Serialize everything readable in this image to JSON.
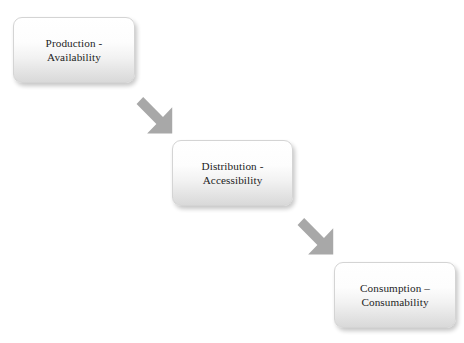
{
  "diagram": {
    "type": "flowchart",
    "orientation": "descending-diagonal",
    "background_color": "#ffffff",
    "nodes": [
      {
        "id": "production",
        "label": "Production -\nAvailability",
        "line_one": "Production -",
        "line_two": "Availability",
        "shape": "rounded-rectangle",
        "fill_top_color": "#ffffff",
        "fill_bottom_color": "#d9d9d9",
        "border_color": "#d4d4d4",
        "text_color": "#1d1d1d"
      },
      {
        "id": "distribution",
        "label": "Distribution -\nAccessibility",
        "line_one": "Distribution -",
        "line_two": "Accessibility",
        "shape": "rounded-rectangle",
        "fill_top_color": "#ffffff",
        "fill_bottom_color": "#d9d9d9",
        "border_color": "#d4d4d4",
        "text_color": "#1d1d1d"
      },
      {
        "id": "consumption",
        "label": "Consumption –\nConsumability",
        "line_one": "Consumption –",
        "line_two": "Consumability",
        "shape": "rounded-rectangle",
        "fill_top_color": "#ffffff",
        "fill_bottom_color": "#d9d9d9",
        "border_color": "#d4d4d4",
        "text_color": "#1d1d1d"
      }
    ],
    "connectors": [
      {
        "id": "arrow-one",
        "from": "production",
        "to": "distribution",
        "style": "block-arrow",
        "direction": "down-right",
        "color": "#a8a8a8"
      },
      {
        "id": "arrow-two",
        "from": "distribution",
        "to": "consumption",
        "style": "block-arrow",
        "direction": "down-right",
        "color": "#a8a8a8"
      }
    ]
  }
}
